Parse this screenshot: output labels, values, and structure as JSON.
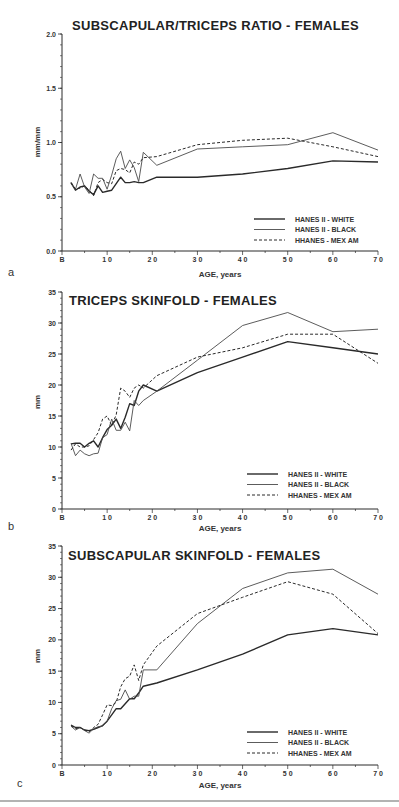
{
  "chart_data": [
    {
      "panel": "a",
      "type": "line",
      "title": "SUBSCAPULAR/TRICEPS RATIO - FEMALES",
      "xlabel": "AGE, years",
      "ylabel": "mm/mm",
      "xlim": [
        0,
        70
      ],
      "ylim": [
        0,
        2.0
      ],
      "xticks": [
        "B",
        "1 0",
        "2 0",
        "3 0",
        "4 0",
        "5 0",
        "6 0",
        "7 0"
      ],
      "yticks": [
        "0.0",
        "0.5",
        "1.0",
        "1.5",
        "2.0"
      ],
      "ytick_values": [
        0,
        0.5,
        1.0,
        1.5,
        2.0
      ],
      "legend_position": "lower right",
      "series": [
        {
          "name": "HANES II - WHITE",
          "style": "solid-thick",
          "x": [
            2,
            3,
            4,
            5,
            6,
            7,
            8,
            9,
            10,
            11,
            12,
            13,
            14,
            15,
            16,
            17,
            18,
            21,
            30,
            40,
            50,
            60,
            70
          ],
          "y": [
            0.63,
            0.56,
            0.59,
            0.6,
            0.55,
            0.52,
            0.6,
            0.54,
            0.55,
            0.56,
            0.62,
            0.68,
            0.63,
            0.63,
            0.64,
            0.63,
            0.63,
            0.68,
            0.68,
            0.71,
            0.76,
            0.83,
            0.82
          ]
        },
        {
          "name": "HANES II - BLACK",
          "style": "solid-thin",
          "x": [
            2,
            3,
            4,
            5,
            6,
            7,
            8,
            9,
            10,
            11,
            12,
            13,
            14,
            15,
            16,
            17,
            18,
            21,
            30,
            40,
            50,
            60,
            70
          ],
          "y": [
            0.62,
            0.57,
            0.71,
            0.59,
            0.53,
            0.71,
            0.67,
            0.67,
            0.57,
            0.7,
            0.85,
            0.92,
            0.76,
            0.84,
            0.77,
            0.64,
            0.91,
            0.79,
            0.94,
            0.96,
            0.98,
            1.09,
            0.93
          ]
        },
        {
          "name": "HHANES - MEX AM",
          "style": "dashed",
          "x": [
            2,
            3,
            4,
            5,
            6,
            7,
            8,
            9,
            10,
            11,
            12,
            13,
            14,
            15,
            16,
            17,
            18,
            21,
            30,
            40,
            50,
            60,
            70
          ],
          "y": [
            0.63,
            0.57,
            0.58,
            0.6,
            0.56,
            0.51,
            0.63,
            0.66,
            0.63,
            0.62,
            0.74,
            0.76,
            0.75,
            0.72,
            0.82,
            0.8,
            0.86,
            0.87,
            0.98,
            1.02,
            1.04,
            0.96,
            0.87
          ]
        }
      ]
    },
    {
      "panel": "b",
      "type": "line",
      "title": "TRICEPS SKINFOLD - FEMALES",
      "xlabel": "AGE, years",
      "ylabel": "mm",
      "xlim": [
        0,
        70
      ],
      "ylim": [
        0,
        35
      ],
      "xticks": [
        "B",
        "1 0",
        "2 0",
        "3 0",
        "4 0",
        "5 0",
        "6 0",
        "7 0"
      ],
      "yticks": [
        "0",
        "5",
        "10",
        "15",
        "20",
        "25",
        "30",
        "35"
      ],
      "ytick_values": [
        0,
        5,
        10,
        15,
        20,
        25,
        30,
        35
      ],
      "legend_position": "lower right",
      "series": [
        {
          "name": "HANES II - WHITE",
          "style": "solid-thick",
          "x": [
            2,
            3,
            4,
            5,
            6,
            7,
            8,
            9,
            10,
            11,
            12,
            13,
            14,
            15,
            16,
            17,
            18,
            21,
            30,
            40,
            50,
            60,
            70
          ],
          "y": [
            10.5,
            10.6,
            10.6,
            10.0,
            10.6,
            11.0,
            10.0,
            11.5,
            12.8,
            13.5,
            14.5,
            13.0,
            14.8,
            17.0,
            16.7,
            19.0,
            20.0,
            19.0,
            22.0,
            24.5,
            27.0,
            26.0,
            25.0
          ]
        },
        {
          "name": "HANES II - BLACK",
          "style": "solid-thin",
          "x": [
            2,
            3,
            4,
            5,
            6,
            7,
            8,
            9,
            10,
            11,
            12,
            13,
            14,
            15,
            16,
            17,
            18,
            21,
            30,
            40,
            50,
            60,
            70
          ],
          "y": [
            10.6,
            8.6,
            9.5,
            8.9,
            8.6,
            8.9,
            9.0,
            11.5,
            12.0,
            14.5,
            12.7,
            12.7,
            14.0,
            12.6,
            17.5,
            16.7,
            17.5,
            19.0,
            24.0,
            29.6,
            31.7,
            28.6,
            29.0
          ]
        },
        {
          "name": "HHANES - MEX AM",
          "style": "dashed",
          "x": [
            2,
            3,
            4,
            5,
            6,
            7,
            8,
            9,
            10,
            11,
            12,
            13,
            14,
            15,
            16,
            17,
            18,
            21,
            30,
            40,
            50,
            60,
            70
          ],
          "y": [
            9.5,
            10.5,
            10.0,
            10.0,
            10.2,
            11.2,
            12.3,
            14.5,
            15.0,
            13.5,
            15.2,
            19.5,
            19.0,
            18.0,
            19.5,
            20.0,
            19.5,
            21.5,
            24.5,
            26.0,
            28.2,
            28.2,
            23.5
          ]
        }
      ]
    },
    {
      "panel": "c",
      "type": "line",
      "title": "SUBSCAPULAR SKINFOLD - FEMALES",
      "xlabel": "AGE, years",
      "ylabel": "mm",
      "xlim": [
        0,
        70
      ],
      "ylim": [
        0,
        35
      ],
      "xticks": [
        "B",
        "1 0",
        "2 0",
        "3 0",
        "4 0",
        "5 0",
        "6 0",
        "7 0"
      ],
      "yticks": [
        "0",
        "5",
        "10",
        "15",
        "20",
        "25",
        "30",
        "35"
      ],
      "ytick_values": [
        0,
        5,
        10,
        15,
        20,
        25,
        30,
        35
      ],
      "legend_position": "lower right",
      "series": [
        {
          "name": "HANES II - WHITE",
          "style": "solid-thick",
          "x": [
            2,
            3,
            4,
            5,
            6,
            7,
            8,
            9,
            10,
            11,
            12,
            13,
            14,
            15,
            16,
            17,
            18,
            21,
            30,
            40,
            50,
            60,
            70
          ],
          "y": [
            6.4,
            6.0,
            6.0,
            5.6,
            5.5,
            5.7,
            6.0,
            6.3,
            7.0,
            8.0,
            9.0,
            9.0,
            9.8,
            10.6,
            10.6,
            11.5,
            12.6,
            13.1,
            15.2,
            17.7,
            20.8,
            21.8,
            20.8
          ]
        },
        {
          "name": "HANES II - BLACK",
          "style": "solid-thin",
          "x": [
            2,
            3,
            4,
            5,
            6,
            7,
            8,
            9,
            10,
            11,
            12,
            13,
            14,
            15,
            16,
            17,
            18,
            21,
            30,
            40,
            50,
            60,
            70
          ],
          "y": [
            6.2,
            5.6,
            6.0,
            5.5,
            5.1,
            5.8,
            6.1,
            6.2,
            7.0,
            9.0,
            10.3,
            10.5,
            12.0,
            10.5,
            11.0,
            11.0,
            15.2,
            15.2,
            22.6,
            28.2,
            30.7,
            31.3,
            27.3
          ]
        },
        {
          "name": "HHANES - MEX AM",
          "style": "dashed",
          "x": [
            2,
            3,
            4,
            5,
            6,
            7,
            8,
            9,
            10,
            11,
            12,
            13,
            14,
            15,
            16,
            17,
            18,
            21,
            30,
            40,
            50,
            60,
            70
          ],
          "y": [
            6.3,
            5.8,
            6.0,
            5.6,
            5.3,
            6.0,
            6.5,
            8.0,
            9.6,
            9.5,
            10.0,
            12.5,
            13.8,
            14.2,
            16.0,
            13.5,
            16.0,
            19.0,
            24.2,
            26.8,
            29.3,
            27.3,
            21.0
          ]
        }
      ]
    }
  ],
  "panels": {
    "a": {
      "label": "a"
    },
    "b": {
      "label": "b"
    },
    "c": {
      "label": "c"
    }
  },
  "legend": {
    "items": [
      "HANES II - WHITE",
      "HANES II - BLACK",
      "HHANES - MEX AM"
    ]
  },
  "colors": {
    "ink": "#2a2a2a",
    "thin_line": "#4a4a4a",
    "background": "#ffffff",
    "rule": "#9a9a9a"
  }
}
